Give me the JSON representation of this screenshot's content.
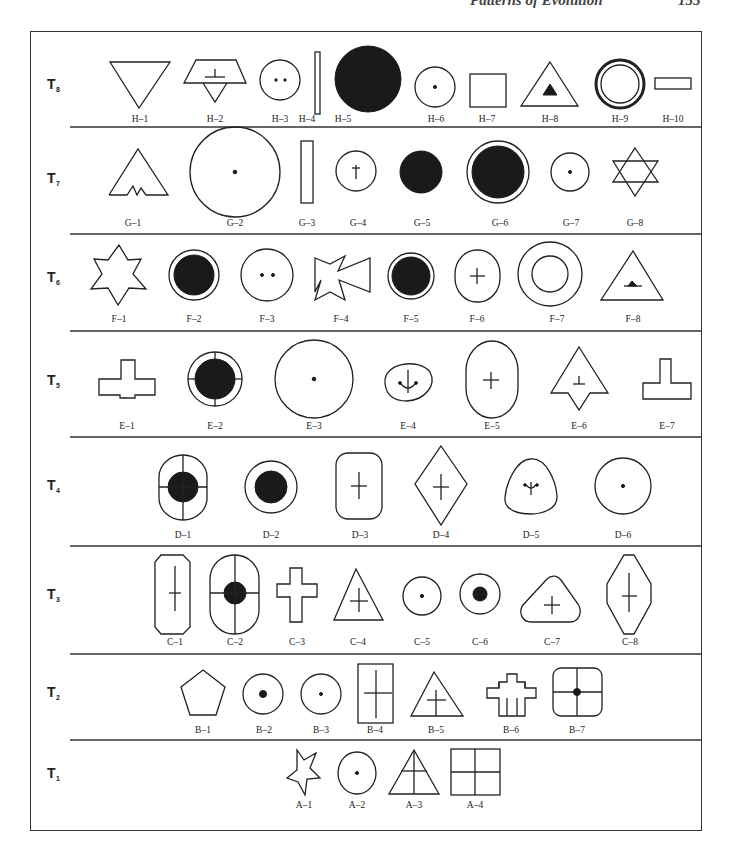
{
  "page": {
    "running_head": "Patterns of Evolution",
    "page_number": "155"
  },
  "tiers": [
    {
      "id": "T8",
      "letter": "T",
      "sub": "8",
      "items": [
        "H–1",
        "H–2",
        "H–3",
        "H–4",
        "H–5",
        "H–6",
        "H–7",
        "H–8",
        "H–9",
        "H–10"
      ]
    },
    {
      "id": "T7",
      "letter": "T",
      "sub": "7",
      "items": [
        "G–1",
        "G–2",
        "G–3",
        "G–4",
        "G–5",
        "G–6",
        "G–7",
        "G–8"
      ]
    },
    {
      "id": "T6",
      "letter": "T",
      "sub": "6",
      "items": [
        "F–1",
        "F–2",
        "F–3",
        "F–4",
        "F–5",
        "F–6",
        "F–7",
        "F–8"
      ]
    },
    {
      "id": "T5",
      "letter": "T",
      "sub": "5",
      "items": [
        "E–1",
        "E–2",
        "E–3",
        "E–4",
        "E–5",
        "E–6",
        "E–7"
      ]
    },
    {
      "id": "T4",
      "letter": "T",
      "sub": "4",
      "items": [
        "D–1",
        "D–2",
        "D–3",
        "D–4",
        "D–5",
        "D–6"
      ]
    },
    {
      "id": "T3",
      "letter": "T",
      "sub": "3",
      "items": [
        "C–1",
        "C–2",
        "C–3",
        "C–4",
        "C–5",
        "C–6",
        "C–7",
        "C–8"
      ]
    },
    {
      "id": "T2",
      "letter": "T",
      "sub": "2",
      "items": [
        "B–1",
        "B–2",
        "B–3",
        "B–4",
        "B–5",
        "B–6",
        "B–7"
      ]
    },
    {
      "id": "T1",
      "letter": "T",
      "sub": "1",
      "items": [
        "A–1",
        "A–2",
        "A–3",
        "A–4"
      ]
    }
  ],
  "shapes": {
    "H-1": "inverted-triangle",
    "H-2": "trapezoid-over-triangle-with-t-mark",
    "H-3": "circle-two-dots",
    "H-4": "tall-thin-rectangle",
    "H-5": "large-filled-circle",
    "H-6": "circle-center-dot",
    "H-7": "square",
    "H-8": "triangle-with-filled-inner-triangle",
    "H-9": "double-ring-circle",
    "H-10": "small-horizontal-rectangle",
    "G-1": "mountain-triangle-with-notches",
    "G-2": "large-circle-center-dot",
    "G-3": "tall-rectangle",
    "G-4": "circle-with-cross",
    "G-5": "filled-circle",
    "G-6": "filled-circle-with-outer-ring",
    "G-7": "circle-center-dot",
    "G-8": "six-point-star",
    "F-1": "six-point-star",
    "F-2": "filled-circle-with-outer-ring",
    "F-3": "circle-two-dots",
    "F-4": "maltese-cross",
    "F-5": "filled-circle-with-outer-ring",
    "F-6": "rounded-oval-with-cross",
    "F-7": "concentric-circles",
    "F-8": "triangle-with-small-mound",
    "E-1": "t-shaped-cross",
    "E-2": "filled-circle-ring-with-ticks",
    "E-3": "large-circle-center-dot",
    "E-4": "rounded-shape-with-anchor",
    "E-5": "tall-oval-with-cross",
    "E-6": "arrowhead-with-t-mark",
    "E-7": "inverted-t-shape",
    "D-1": "oval-with-filled-circle-and-cross",
    "D-2": "circle-with-filled-circle",
    "D-3": "rounded-rectangle-with-cross",
    "D-4": "diamond-with-cross",
    "D-5": "rounded-triangle-with-anchor",
    "D-6": "circle-center-dot",
    "C-1": "octagonal-rectangle-with-cross",
    "C-2": "oval-with-filled-circle-and-cross",
    "C-3": "greek-cross",
    "C-4": "triangle-with-cross",
    "C-5": "circle-center-dot",
    "C-6": "circle-with-filled-dot",
    "C-7": "rounded-triangle-with-cross",
    "C-8": "elongated-octagon-with-cross",
    "B-1": "pentagon",
    "B-2": "circle-with-filled-dot",
    "B-3": "circle-center-dot",
    "B-4": "rectangle-with-cross",
    "B-5": "triangle-with-cross",
    "B-6": "stepped-cross",
    "B-7": "rounded-square-quartered-with-dot",
    "A-1": "five-point-star",
    "A-2": "circle-center-dot",
    "A-3": "triangle-with-cross",
    "A-4": "square-quartered"
  }
}
